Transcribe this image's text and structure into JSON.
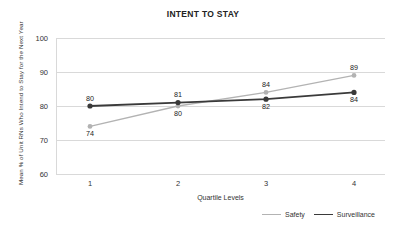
{
  "chart_data": {
    "type": "line",
    "title": "INTENT TO STAY",
    "xlabel": "Quartile Levels",
    "ylabel": "Mean % of Unit RNs Who Intend to Stay for the Next Year",
    "categories": [
      "1",
      "2",
      "3",
      "4"
    ],
    "x": [
      1,
      2,
      3,
      4
    ],
    "ylim": [
      60,
      100
    ],
    "yticks": [
      "60",
      "70",
      "80",
      "90",
      "100"
    ],
    "xticks": [
      "1",
      "2",
      "3",
      "4"
    ],
    "grid": "horizontal",
    "legend_position": "bottom-right",
    "series": [
      {
        "name": "Safety",
        "color": "#b3b3b3",
        "values": [
          74,
          80,
          84,
          89
        ],
        "labels": [
          "74",
          "80",
          "84",
          "89"
        ],
        "label_positions": [
          "below",
          "below",
          "above",
          "above"
        ]
      },
      {
        "name": "Surveillance",
        "color": "#3a3a3a",
        "values": [
          80,
          81,
          82,
          84
        ],
        "labels": [
          "80",
          "81",
          "82",
          "84"
        ],
        "label_positions": [
          "above",
          "above",
          "below",
          "below"
        ]
      }
    ]
  },
  "legend": {
    "items": [
      {
        "label": "Safety",
        "color": "#b3b3b3"
      },
      {
        "label": "Surveillance",
        "color": "#3a3a3a"
      }
    ]
  }
}
